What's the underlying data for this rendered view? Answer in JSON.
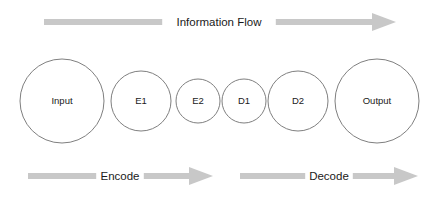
{
  "diagram": {
    "background_color": "#ffffff",
    "node_stroke_color": "#7f7f7f",
    "node_fill_color": "#ffffff",
    "arrow_color": "#c8c8c8",
    "text_color": "#1a1a1a"
  },
  "top_arrow": {
    "label": "Information Flow",
    "direction": "right",
    "x_start": 44,
    "x_end": 396,
    "y": 22,
    "label_x": 219
  },
  "nodes": [
    {
      "id": "input",
      "label": "Input",
      "cx": 62,
      "cy": 101,
      "r": 42,
      "size": "lg"
    },
    {
      "id": "e1",
      "label": "E1",
      "cx": 141,
      "cy": 101,
      "r": 30,
      "size": "md"
    },
    {
      "id": "e2",
      "label": "E2",
      "cx": 198,
      "cy": 101,
      "r": 22,
      "size": "sm"
    },
    {
      "id": "d1",
      "label": "D1",
      "cx": 244,
      "cy": 101,
      "r": 22,
      "size": "sm"
    },
    {
      "id": "d2",
      "label": "D2",
      "cx": 298,
      "cy": 101,
      "r": 30,
      "size": "md"
    },
    {
      "id": "output",
      "label": "Output",
      "cx": 377,
      "cy": 101,
      "r": 42,
      "size": "lg"
    }
  ],
  "bottom_arrows": [
    {
      "id": "encode",
      "label": "Encode",
      "direction": "right",
      "x_start": 28,
      "x_end": 213,
      "y": 176,
      "label_x": 120
    },
    {
      "id": "decode",
      "label": "Decode",
      "direction": "right",
      "x_start": 240,
      "x_end": 418,
      "y": 176,
      "label_x": 329
    }
  ]
}
